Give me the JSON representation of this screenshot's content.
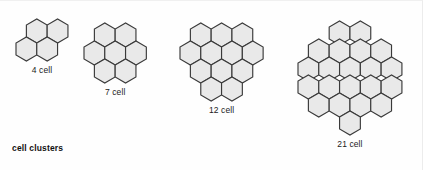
{
  "figure": {
    "caption": "cell clusters",
    "background_color": "#fefefe",
    "hex_fill_color": "#e9e9e9",
    "hex_stroke_color": "#3a3a3a",
    "text_color": "#1c1c1c"
  },
  "chart_data": {
    "type": "diagram",
    "title": "cell clusters",
    "orientation": "flat-top hexagons packed in honeycomb lattice",
    "clusters": [
      {
        "id": "cluster-4",
        "label": "4 cell",
        "count": 4,
        "rows": [
          2,
          2
        ],
        "row_offsets": [
          0.5,
          0.0
        ],
        "origin_x": 14,
        "origin_y": 16,
        "hex_radius": 12
      },
      {
        "id": "cluster-7",
        "label": "7 cell",
        "count": 7,
        "rows": [
          2,
          3,
          2
        ],
        "row_offsets": [
          0.5,
          0.0,
          0.5
        ],
        "origin_x": 82,
        "origin_y": 20,
        "hex_radius": 12
      },
      {
        "id": "cluster-12",
        "label": "12 cell",
        "count": 12,
        "rows": [
          3,
          4,
          3,
          2
        ],
        "row_offsets": [
          0.5,
          0.0,
          0.5,
          1.0
        ],
        "origin_x": 178,
        "origin_y": 20,
        "hex_radius": 12
      },
      {
        "id": "cluster-21",
        "label": "21 cell",
        "count": 21,
        "rows": [
          2,
          4,
          5,
          5,
          4,
          1
        ],
        "row_offsets": [
          2.0,
          1.0,
          0.5,
          0.5,
          1.0,
          2.5
        ],
        "origin_x": 296,
        "origin_y": 18,
        "hex_radius": 12
      }
    ],
    "labels": [
      "4 cell",
      "7 cell",
      "12 cell",
      "21 cell"
    ],
    "values": [
      4,
      7,
      12,
      21
    ]
  }
}
